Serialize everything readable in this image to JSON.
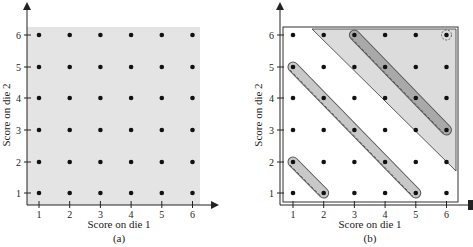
{
  "panel_a": {
    "caption": "(a)",
    "xlabel": "Score on die 1",
    "ylabel": "Score on die 2",
    "x_ticks": [
      "1",
      "2",
      "3",
      "4",
      "5",
      "6"
    ],
    "y_ticks": [
      "1",
      "2",
      "3",
      "4",
      "5",
      "6"
    ],
    "shading": "entire sample space (36 outcomes)"
  },
  "panel_b": {
    "caption": "(b)",
    "xlabel": "Score on die 1",
    "ylabel": "Score on die 2",
    "x_ticks": [
      "1",
      "2",
      "3",
      "4",
      "5",
      "6"
    ],
    "y_ticks": [
      "1",
      "2",
      "3",
      "4",
      "5",
      "6"
    ],
    "shaded_region": "triangle above line through (1.6,6.1) and (6.1,1.7)",
    "groups": [
      {
        "name": "sum-3",
        "points": [
          [
            1,
            2
          ],
          [
            2,
            1
          ]
        ]
      },
      {
        "name": "sum-6",
        "points": [
          [
            1,
            5
          ],
          [
            2,
            4
          ],
          [
            3,
            3
          ],
          [
            4,
            2
          ],
          [
            5,
            1
          ]
        ]
      },
      {
        "name": "sum-9",
        "points": [
          [
            3,
            6
          ],
          [
            4,
            5
          ],
          [
            5,
            4
          ],
          [
            6,
            3
          ]
        ]
      },
      {
        "name": "sum-12",
        "points": [
          [
            6,
            6
          ]
        ]
      }
    ]
  },
  "colors": {
    "shade": "#e4e4e4",
    "band": "#c8c8c8",
    "dot": "#111111",
    "axis": "#222222"
  }
}
